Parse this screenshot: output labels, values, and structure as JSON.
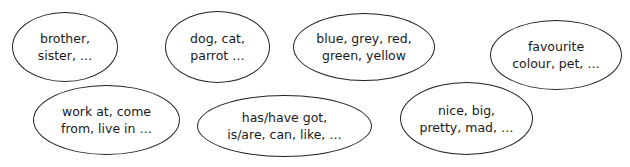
{
  "bubbles": [
    {
      "id": "family",
      "lines": [
        "brother,",
        "sister, …"
      ],
      "box": {
        "left": 12,
        "top": 12,
        "width": 106,
        "height": 70
      }
    },
    {
      "id": "pets",
      "lines": [
        "dog, cat,",
        "parrot …"
      ],
      "box": {
        "left": 165,
        "top": 11,
        "width": 105,
        "height": 72
      }
    },
    {
      "id": "colours",
      "lines": [
        "blue, grey, red,",
        "green, yellow"
      ],
      "box": {
        "left": 293,
        "top": 13,
        "width": 142,
        "height": 68
      }
    },
    {
      "id": "favourites",
      "lines": [
        "favourite",
        "colour, pet, …"
      ],
      "box": {
        "left": 490,
        "top": 20,
        "width": 132,
        "height": 70
      }
    },
    {
      "id": "verbs-places",
      "lines": [
        "work at, come",
        "from, live in …"
      ],
      "box": {
        "left": 33,
        "top": 85,
        "width": 147,
        "height": 70
      }
    },
    {
      "id": "verbs-basic",
      "lines": [
        "has/have got,",
        "is/are, can, like, …"
      ],
      "box": {
        "left": 197,
        "top": 95,
        "width": 175,
        "height": 62
      }
    },
    {
      "id": "adjectives",
      "lines": [
        "nice, big,",
        "pretty, mad, …"
      ],
      "box": {
        "left": 400,
        "top": 82,
        "width": 133,
        "height": 73
      }
    }
  ],
  "colors": {
    "stroke": "#222222",
    "text": "#1a1a1a",
    "background": "#ffffff"
  }
}
